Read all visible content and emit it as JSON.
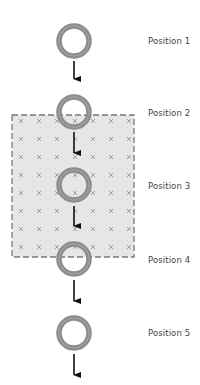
{
  "diagram": {
    "title": "",
    "colors": {
      "background": "#ffffff",
      "field_fill": "#e6e6e6",
      "field_border": "#777777",
      "field_mark": "#9a9a9a",
      "ring": "#8c8c8c",
      "ring_highlight": "#a8a8a8",
      "arrow": "#111111",
      "label": "#444444"
    },
    "field_region": {
      "x": 12,
      "y": 115,
      "width": 122,
      "height": 142,
      "mark_symbol": "×",
      "mark_cols": [
        21,
        39,
        57,
        75,
        93,
        111,
        129
      ],
      "mark_rows": [
        121,
        139,
        157,
        175,
        193,
        211,
        229,
        247
      ]
    },
    "rings": [
      {
        "id": "ring-1",
        "cx": 74,
        "cy": 41
      },
      {
        "id": "ring-2",
        "cx": 74,
        "cy": 112
      },
      {
        "id": "ring-3",
        "cx": 74,
        "cy": 185
      },
      {
        "id": "ring-4",
        "cx": 74,
        "cy": 259
      },
      {
        "id": "ring-5",
        "cx": 74,
        "cy": 333
      }
    ],
    "ring_radius": 15,
    "ring_stroke": 5.5,
    "arrows": [
      {
        "x": 74,
        "y1": 61,
        "y2": 86
      },
      {
        "x": 74,
        "y1": 132,
        "y2": 160
      },
      {
        "x": 74,
        "y1": 206,
        "y2": 233
      },
      {
        "x": 74,
        "y1": 280,
        "y2": 308
      },
      {
        "x": 74,
        "y1": 354,
        "y2": 382
      }
    ],
    "labels": [
      {
        "text": "Position 1",
        "y": 36
      },
      {
        "text": "Position 2",
        "y": 108
      },
      {
        "text": "Position 3",
        "y": 181
      },
      {
        "text": "Position 4",
        "y": 255
      },
      {
        "text": "Position 5",
        "y": 328
      }
    ]
  }
}
